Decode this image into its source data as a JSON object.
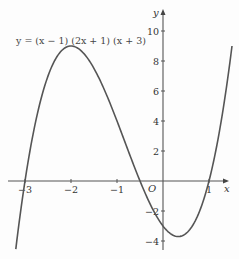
{
  "chart_data": {
    "type": "line",
    "title": "",
    "annotation": "y = (x − 1) (2x + 1) (x + 3)",
    "xlabel": "x",
    "ylabel": "y",
    "origin_label": "O",
    "xlim": [
      -3.2,
      1.5
    ],
    "ylim": [
      -4.5,
      10.5
    ],
    "x_ticks": [
      -3,
      -2,
      -1,
      1
    ],
    "x_tick_labels": [
      "−3",
      "−2",
      "−1",
      "1"
    ],
    "y_ticks": [
      -4,
      -2,
      2,
      4,
      6,
      8,
      10
    ],
    "y_tick_labels": [
      "−4",
      "−2",
      "2",
      "4",
      "6",
      "8",
      "10"
    ],
    "grid": false,
    "legend": null,
    "series": [
      {
        "name": "y = (x − 1)(2x + 1)(x + 3)",
        "function": "(x-1)*(2*x+1)*(x+3)",
        "x": [
          -3.2,
          -3,
          -2.5,
          -2,
          -1.5,
          -1,
          -0.5,
          0,
          0.25,
          0.5,
          1,
          1.5
        ],
        "values": [
          -4.54,
          0,
          7.0,
          9.0,
          7.5,
          4.0,
          0,
          -3.0,
          -3.59,
          -3.5,
          0,
          9.0
        ]
      }
    ],
    "roots": [
      -3,
      -0.5,
      1
    ],
    "local_max": {
      "x": -2,
      "y": 9
    },
    "local_min": {
      "x": 0.25,
      "y": -3.6
    }
  }
}
